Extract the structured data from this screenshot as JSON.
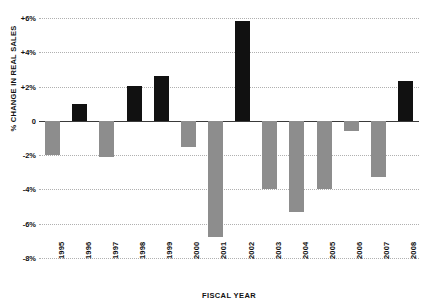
{
  "chart_data": {
    "type": "bar",
    "title": "",
    "xlabel": "FISCAL YEAR",
    "ylabel": "% CHANGE IN REAL SALES",
    "categories": [
      "1995",
      "1996",
      "1997",
      "1998",
      "1999",
      "2000",
      "2001",
      "2002",
      "2003",
      "2004",
      "2005",
      "2006",
      "2007",
      "2008"
    ],
    "values": [
      -2.0,
      1.0,
      -2.1,
      2.05,
      2.6,
      -1.55,
      -6.8,
      5.8,
      -4.0,
      -5.3,
      -4.0,
      -0.6,
      -3.3,
      2.3
    ],
    "ylim": [
      -8,
      6
    ],
    "y_ticks": [
      6,
      4,
      2,
      0,
      -2,
      -4,
      -6,
      -8
    ],
    "y_tick_labels": [
      "+6%",
      "+4%",
      "+2%",
      "0",
      "-2%",
      "-4%",
      "-6%",
      "-8%"
    ],
    "grid": true,
    "legend": "none",
    "colors": {
      "positive_bar": "#111111",
      "negative_bar": "#8d8d8d",
      "gridline": "#b0b0b0",
      "zero_line": "#3a3a3a",
      "background": "#ffffff",
      "text": "#111111"
    }
  }
}
